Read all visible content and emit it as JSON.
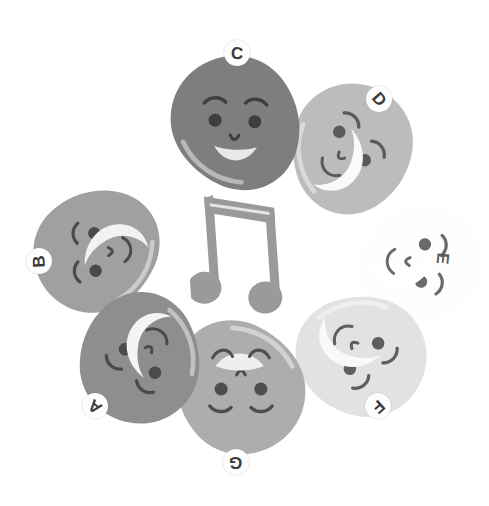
{
  "scene": {
    "title": "Potato characters arranged in a circle around a music note",
    "background_color": "#ffffff",
    "width": 484,
    "height": 506
  },
  "center_icon": {
    "name": "music-note-icon",
    "glyph": "beamed-eighth-notes",
    "color": "#9a9a9a",
    "rotation_deg": -4
  },
  "characters": [
    {
      "label": "A",
      "body_color": "#8e8e8e",
      "feature_color": "#4a4a4a",
      "mouth_color": "#f4f4f4",
      "mouth_style": "crescent",
      "x": 72,
      "y": 293,
      "size": 136,
      "rotation_deg": 218,
      "badge_x": 82,
      "badge_y": 393,
      "badge_rotation_deg": 218,
      "badge_visible": true
    },
    {
      "label": "B",
      "body_color": "#a0a0a0",
      "feature_color": "#4a4a4a",
      "mouth_color": "#f2f2f2",
      "mouth_style": "crescent",
      "x": 28,
      "y": 185,
      "size": 134,
      "rotation_deg": 268,
      "badge_x": 26,
      "badge_y": 248,
      "badge_rotation_deg": 268,
      "badge_visible": true
    },
    {
      "label": "C",
      "body_color": "#7e7e7e",
      "feature_color": "#3e3e3e",
      "mouth_color": "#e8e8e8",
      "mouth_style": "open-smile",
      "x": 164,
      "y": 50,
      "size": 142,
      "rotation_deg": 2,
      "badge_x": 224,
      "badge_y": 40,
      "badge_rotation_deg": 2,
      "badge_visible": true
    },
    {
      "label": "D",
      "body_color": "#bcbcbc",
      "feature_color": "#5a5a5a",
      "mouth_color": "#fafafa",
      "mouth_style": "crescent",
      "x": 284,
      "y": 78,
      "size": 136,
      "rotation_deg": 48,
      "badge_x": 366,
      "badge_y": 86,
      "badge_rotation_deg": 48,
      "badge_visible": true
    },
    {
      "label": "E",
      "body_color": "#fefefe",
      "feature_color": "#6a6a6a",
      "mouth_color": "#ffffff",
      "mouth_style": "crescent",
      "x": 356,
      "y": 196,
      "size": 134,
      "rotation_deg": 96,
      "badge_x": 430,
      "badge_y": 245,
      "badge_rotation_deg": 96,
      "badge_visible": false
    },
    {
      "label": "F",
      "body_color": "#e2e2e2",
      "feature_color": "#5e5e5e",
      "mouth_color": "#f9f9f9",
      "mouth_style": "crescent",
      "x": 296,
      "y": 288,
      "size": 136,
      "rotation_deg": 138,
      "badge_x": 365,
      "badge_y": 393,
      "badge_rotation_deg": 138,
      "badge_visible": true
    },
    {
      "label": "G",
      "body_color": "#adadad",
      "feature_color": "#4e4e4e",
      "mouth_color": "#efefef",
      "mouth_style": "half-moon",
      "x": 170,
      "y": 318,
      "size": 142,
      "rotation_deg": 180,
      "badge_x": 223,
      "badge_y": 449,
      "badge_rotation_deg": 180,
      "badge_visible": true
    }
  ]
}
